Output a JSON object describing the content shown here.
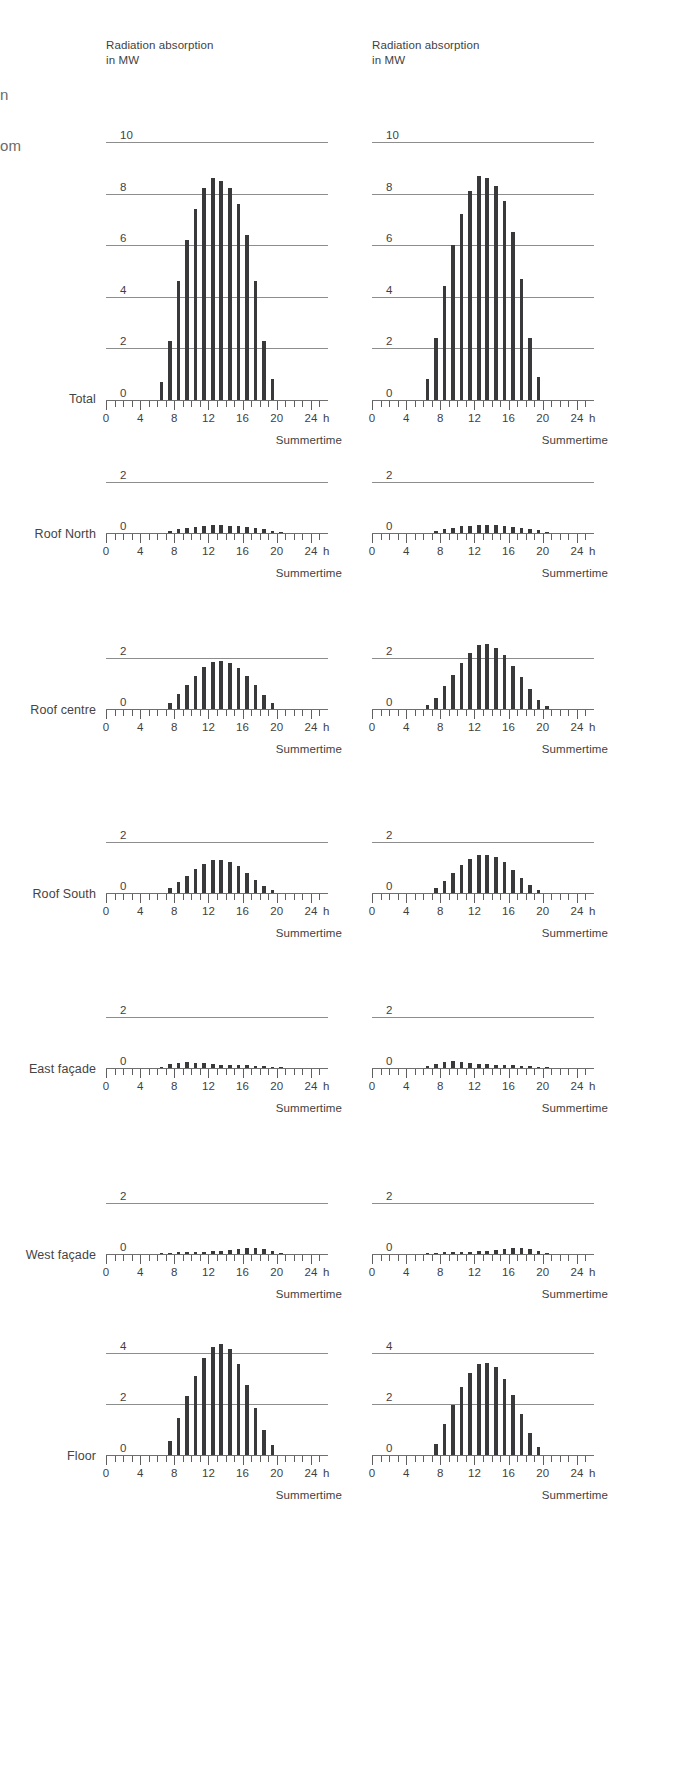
{
  "page": {
    "background": "#ffffff",
    "ink": "#39393b",
    "grid_color": "#8d8d8d",
    "cropped_fragments": [
      {
        "text": "n",
        "x": 0,
        "y": 86
      },
      {
        "text": "om",
        "x": 0,
        "y": 137
      }
    ]
  },
  "axis": {
    "x_title_unit": "h",
    "x_caption": "Summertime",
    "x_ticks_major": [
      "0",
      "4",
      "8",
      "12",
      "16",
      "20",
      "24"
    ],
    "x_min": 0,
    "x_max": 26,
    "x_tick_step_minor": 1,
    "x_tick_step_major": 4
  },
  "column_header": "Radiation absorption\nin MW",
  "rows": [
    {
      "label": "Total",
      "ymax": 10,
      "yticks": [
        0,
        2,
        4,
        6,
        8,
        10
      ]
    },
    {
      "label": "Roof North",
      "ymax": 2,
      "yticks": [
        0,
        2
      ]
    },
    {
      "label": "Roof centre",
      "ymax": 2,
      "yticks": [
        0,
        2
      ]
    },
    {
      "label": "Roof South",
      "ymax": 2,
      "yticks": [
        0,
        2
      ]
    },
    {
      "label": "East façade",
      "ymax": 2,
      "yticks": [
        0,
        2
      ]
    },
    {
      "label": "West façade",
      "ymax": 2,
      "yticks": [
        0,
        2
      ]
    },
    {
      "label": "Floor",
      "ymax": 4,
      "yticks": [
        0,
        2,
        4
      ]
    }
  ],
  "chart_data": {
    "type": "bar",
    "title": "Radiation absorption in MW",
    "xlabel": "Summertime",
    "ylabel": "Radiation absorption in MW",
    "x_unit": "h",
    "x": [
      0,
      1,
      2,
      3,
      4,
      5,
      6,
      7,
      8,
      9,
      10,
      11,
      12,
      13,
      14,
      15,
      16,
      17,
      18,
      19,
      20,
      21,
      22,
      23
    ],
    "panels": [
      {
        "row": "Total",
        "column": 1,
        "ylim": [
          0,
          10
        ],
        "yticks": [
          0,
          2,
          4,
          6,
          8,
          10
        ],
        "values": [
          0,
          0,
          0,
          0,
          0,
          0,
          0.7,
          2.3,
          4.6,
          6.2,
          7.4,
          8.2,
          8.6,
          8.5,
          8.2,
          7.6,
          6.4,
          4.6,
          2.3,
          0.8,
          0,
          0,
          0,
          0
        ]
      },
      {
        "row": "Total",
        "column": 2,
        "ylim": [
          0,
          10
        ],
        "yticks": [
          0,
          2,
          4,
          6,
          8,
          10
        ],
        "values": [
          0,
          0,
          0,
          0,
          0,
          0,
          0.8,
          2.4,
          4.4,
          6.0,
          7.2,
          8.1,
          8.7,
          8.6,
          8.3,
          7.7,
          6.5,
          4.7,
          2.4,
          0.9,
          0,
          0,
          0,
          0
        ]
      },
      {
        "row": "Roof North",
        "column": 1,
        "ylim": [
          0,
          2
        ],
        "yticks": [
          0,
          2
        ],
        "values": [
          0,
          0,
          0,
          0,
          0,
          0,
          0,
          0.07,
          0.14,
          0.2,
          0.25,
          0.28,
          0.3,
          0.3,
          0.29,
          0.27,
          0.24,
          0.2,
          0.15,
          0.09,
          0.04,
          0,
          0,
          0
        ]
      },
      {
        "row": "Roof North",
        "column": 2,
        "ylim": [
          0,
          2
        ],
        "yticks": [
          0,
          2
        ],
        "values": [
          0,
          0,
          0,
          0,
          0,
          0,
          0,
          0.07,
          0.15,
          0.21,
          0.26,
          0.29,
          0.31,
          0.31,
          0.3,
          0.28,
          0.25,
          0.21,
          0.16,
          0.1,
          0.04,
          0,
          0,
          0
        ]
      },
      {
        "row": "Roof centre",
        "column": 1,
        "ylim": [
          0,
          2
        ],
        "yticks": [
          0,
          2
        ],
        "values": [
          0,
          0,
          0,
          0,
          0,
          0,
          0,
          0.25,
          0.6,
          0.95,
          1.3,
          1.65,
          1.85,
          1.9,
          1.8,
          1.6,
          1.3,
          0.95,
          0.55,
          0.22,
          0,
          0,
          0,
          0
        ]
      },
      {
        "row": "Roof centre",
        "column": 2,
        "ylim": [
          0,
          2
        ],
        "yticks": [
          0,
          2
        ],
        "values": [
          0,
          0,
          0,
          0,
          0,
          0,
          0.15,
          0.45,
          0.9,
          1.35,
          1.8,
          2.2,
          2.5,
          2.55,
          2.4,
          2.1,
          1.7,
          1.25,
          0.8,
          0.35,
          0.1,
          0,
          0,
          0
        ]
      },
      {
        "row": "Roof South",
        "column": 1,
        "ylim": [
          0,
          2
        ],
        "yticks": [
          0,
          2
        ],
        "values": [
          0,
          0,
          0,
          0,
          0,
          0,
          0,
          0.18,
          0.42,
          0.68,
          0.95,
          1.15,
          1.28,
          1.3,
          1.22,
          1.05,
          0.8,
          0.52,
          0.28,
          0.1,
          0,
          0,
          0,
          0
        ]
      },
      {
        "row": "Roof South",
        "column": 2,
        "ylim": [
          0,
          2
        ],
        "yticks": [
          0,
          2
        ],
        "values": [
          0,
          0,
          0,
          0,
          0,
          0,
          0,
          0.2,
          0.48,
          0.78,
          1.08,
          1.32,
          1.48,
          1.5,
          1.4,
          1.2,
          0.92,
          0.6,
          0.32,
          0.12,
          0,
          0,
          0,
          0
        ]
      },
      {
        "row": "East façade",
        "column": 1,
        "ylim": [
          0,
          2
        ],
        "yticks": [
          0,
          2
        ],
        "values": [
          0,
          0,
          0,
          0,
          0,
          0,
          0.05,
          0.14,
          0.2,
          0.22,
          0.21,
          0.18,
          0.15,
          0.13,
          0.12,
          0.11,
          0.1,
          0.09,
          0.07,
          0.04,
          0.02,
          0,
          0,
          0
        ]
      },
      {
        "row": "East façade",
        "column": 2,
        "ylim": [
          0,
          2
        ],
        "yticks": [
          0,
          2
        ],
        "values": [
          0,
          0,
          0,
          0,
          0,
          0,
          0.06,
          0.16,
          0.24,
          0.26,
          0.24,
          0.2,
          0.16,
          0.14,
          0.13,
          0.12,
          0.11,
          0.09,
          0.07,
          0.04,
          0.02,
          0,
          0,
          0
        ]
      },
      {
        "row": "West façade",
        "column": 1,
        "ylim": [
          0,
          2
        ],
        "yticks": [
          0,
          2
        ],
        "values": [
          0,
          0,
          0,
          0,
          0,
          0,
          0.02,
          0.04,
          0.06,
          0.07,
          0.08,
          0.09,
          0.1,
          0.12,
          0.15,
          0.18,
          0.22,
          0.22,
          0.18,
          0.1,
          0.04,
          0,
          0,
          0
        ]
      },
      {
        "row": "West façade",
        "column": 2,
        "ylim": [
          0,
          2
        ],
        "yticks": [
          0,
          2
        ],
        "values": [
          0,
          0,
          0,
          0,
          0,
          0,
          0.02,
          0.04,
          0.06,
          0.07,
          0.08,
          0.09,
          0.11,
          0.13,
          0.16,
          0.2,
          0.24,
          0.24,
          0.19,
          0.11,
          0.04,
          0,
          0,
          0
        ]
      },
      {
        "row": "Floor",
        "column": 1,
        "ylim": [
          0,
          4
        ],
        "yticks": [
          0,
          2,
          4
        ],
        "values": [
          0,
          0,
          0,
          0,
          0,
          0,
          0,
          0.55,
          1.45,
          2.3,
          3.1,
          3.8,
          4.25,
          4.35,
          4.15,
          3.55,
          2.75,
          1.85,
          1.0,
          0.38,
          0,
          0,
          0,
          0
        ]
      },
      {
        "row": "Floor",
        "column": 2,
        "ylim": [
          0,
          4
        ],
        "yticks": [
          0,
          2,
          4
        ],
        "values": [
          0,
          0,
          0,
          0,
          0,
          0,
          0,
          0.45,
          1.2,
          1.95,
          2.65,
          3.2,
          3.55,
          3.6,
          3.45,
          3.0,
          2.35,
          1.6,
          0.88,
          0.32,
          0,
          0,
          0,
          0
        ]
      }
    ]
  },
  "layout": {
    "columns": [
      {
        "chart_left": 106,
        "plot_width": 222,
        "title_left": 106
      },
      {
        "chart_left": 372,
        "plot_width": 222,
        "title_left": 372
      }
    ],
    "rows": [
      {
        "label_y": 392,
        "base_y": 400,
        "unit_px": 25.8,
        "title_y": 38,
        "show_title": true
      },
      {
        "label_y": 527,
        "base_y": 533,
        "unit_px": 25.5,
        "show_title": false
      },
      {
        "label_y": 703,
        "base_y": 709,
        "unit_px": 25.5,
        "show_title": false
      },
      {
        "label_y": 887,
        "base_y": 893,
        "unit_px": 25.5,
        "show_title": false
      },
      {
        "label_y": 1062,
        "base_y": 1068,
        "unit_px": 25.5,
        "show_title": false
      },
      {
        "label_y": 1248,
        "base_y": 1254,
        "unit_px": 25.5,
        "show_title": false
      },
      {
        "label_y": 1449,
        "base_y": 1455,
        "unit_px": 25.5,
        "show_title": false
      }
    ]
  }
}
